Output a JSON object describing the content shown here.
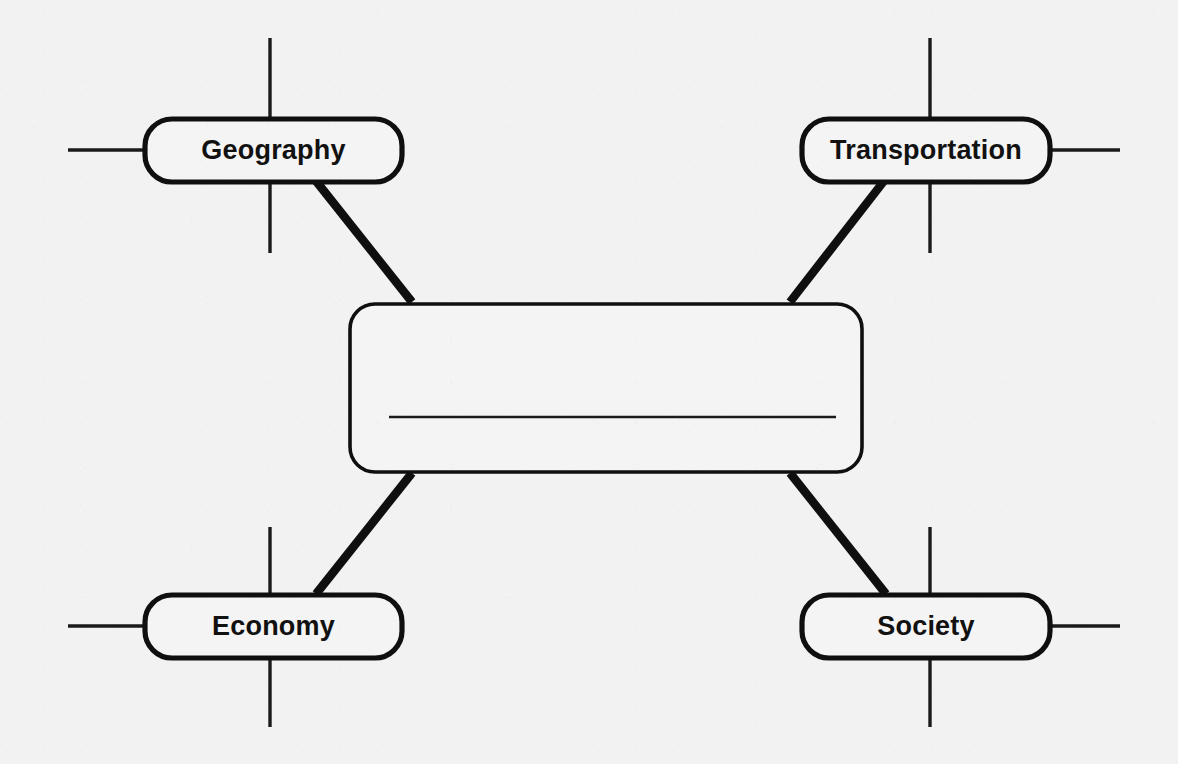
{
  "worksheet": {
    "type": "concept-map-diagram",
    "background_color": "#f2f2f2",
    "line_color": "#100f0f",
    "box_fill_color": "#f4f4f4",
    "center": {
      "label": "",
      "is_blank": true,
      "answer_line": true
    },
    "nodes": [
      {
        "id": "geography",
        "label": "Geography",
        "position": "top-left",
        "stub_side": "left"
      },
      {
        "id": "transportation",
        "label": "Transportation",
        "position": "top-right",
        "stub_side": "right"
      },
      {
        "id": "economy",
        "label": "Economy",
        "position": "bottom-left",
        "stub_side": "left"
      },
      {
        "id": "society",
        "label": "Society",
        "position": "bottom-right",
        "stub_side": "right"
      }
    ],
    "connections": [
      {
        "from": "geography",
        "to": "center"
      },
      {
        "from": "transportation",
        "to": "center"
      },
      {
        "from": "economy",
        "to": "center"
      },
      {
        "from": "society",
        "to": "center"
      }
    ]
  }
}
